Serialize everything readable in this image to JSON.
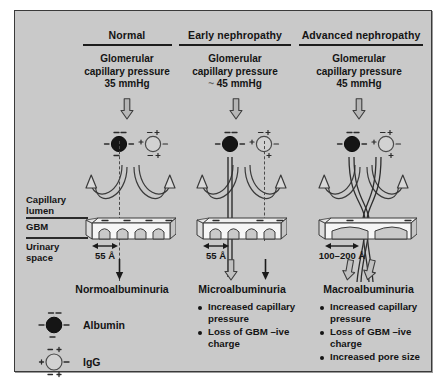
{
  "figure": {
    "background_color": "#c9c9c9",
    "border_color": "#3a3a3a",
    "title_rule_color": "#1c1c1c"
  },
  "columns": [
    {
      "id": "normal",
      "title": "Normal",
      "pressure_line1": "Glomerular",
      "pressure_line2": "capillary pressure",
      "pressure_line3": "35 mmHg",
      "pressure_value": "35 mmHg",
      "approx_symbol": "",
      "pore_size": "55 Å",
      "outcome": "Normoalbuminuria",
      "bullets": []
    },
    {
      "id": "early-nephropathy",
      "title": "Early nephropathy",
      "pressure_line1": "Glomerular",
      "pressure_line2": "capillary pressure",
      "pressure_line3": "45 mmHg",
      "pressure_value": "45 mmHg",
      "approx_symbol": "~",
      "pore_size": "55 Å",
      "outcome": "Microalbuminuria",
      "bullets": [
        "Increased capillary pressure",
        "Loss of GBM –ive charge"
      ]
    },
    {
      "id": "advanced-nephropathy",
      "title": "Advanced nephropathy",
      "pressure_line1": "Glomerular",
      "pressure_line2": "capillary pressure",
      "pressure_line3": "45 mmHg",
      "pressure_value": "45 mmHg",
      "approx_symbol": "",
      "pore_size": "100–200 Å",
      "outcome": "Macroalbuminuria",
      "bullets": [
        "Increased capillary pressure",
        "Loss of GBM –ive charge",
        "Increased pore size"
      ]
    }
  ],
  "row_labels": {
    "capillary_lumen_line1": "Capillary",
    "capillary_lumen_line2": "lumen",
    "gbm": "GBM",
    "urinary_space_line1": "Urinary",
    "urinary_space_line2": "space"
  },
  "legend": [
    {
      "id": "albumin",
      "label": "Albumin",
      "fill": "#1a1a1a",
      "charges": "all-negative"
    },
    {
      "id": "igg",
      "label": "IgG",
      "fill": "#cfcfcf",
      "charges": "mixed"
    }
  ],
  "icons": {
    "block_arrow_down": "hollow-block-arrow-down",
    "thin_arrow_down": "thin-arrow-down",
    "bounce_arrow": "curved-bounce-arrow",
    "albumin_molecule": "albumin-particle",
    "igg_molecule": "igg-particle",
    "gbm_slab": "gbm-basement-membrane-slab",
    "pore_measure": "double-headed-measure-arrow"
  }
}
